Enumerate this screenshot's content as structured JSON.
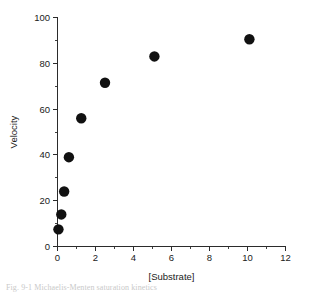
{
  "figure": {
    "background_color": "#ffffff",
    "marker_color": "#111111",
    "axis_color": "#2b2b2b",
    "caption_partial": "Fig. 9-1  Michaelis-Menten saturation kinetics"
  },
  "chart_data": {
    "type": "scatter",
    "title": "",
    "xlabel": "[Substrate]",
    "ylabel": "Velocity",
    "xlim": [
      0,
      12
    ],
    "ylim": [
      0,
      100
    ],
    "grid": false,
    "legend": false,
    "legend_position": "none",
    "xticks": [
      0,
      2,
      4,
      6,
      8,
      10,
      12
    ],
    "xtick_labels": [
      "0",
      "2",
      "4",
      "6",
      "8",
      "10",
      "12"
    ],
    "xminor_step": 1,
    "yticks": [
      0,
      20,
      40,
      60,
      80,
      100
    ],
    "ytick_labels": [
      "0",
      "20",
      "40",
      "60",
      "80",
      "100"
    ],
    "yminor_step": 10,
    "marker": "filled-circle",
    "marker_size": 5.2,
    "series": [
      {
        "name": "velocity",
        "x": [
          0.05,
          0.2,
          0.35,
          0.6,
          1.25,
          2.5,
          5.1,
          10.1
        ],
        "y": [
          7.5,
          14,
          24,
          39,
          56,
          71.5,
          83,
          90.5
        ]
      }
    ]
  }
}
